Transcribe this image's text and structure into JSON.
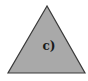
{
  "figure": {
    "shape": "triangle",
    "label": "c)",
    "fill_color": "#a9a9a9",
    "stroke_color": "#3a3a3a"
  }
}
